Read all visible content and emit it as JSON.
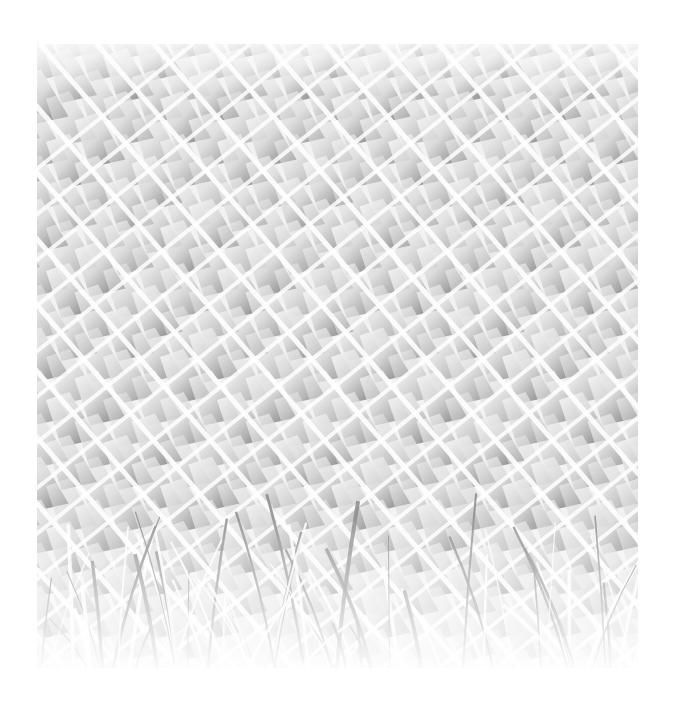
{
  "image": {
    "description": "High-key grayscale photograph of a diagonal chain-link / lattice fence with grass blades in the foreground",
    "alt": "Chain-link fence with grass",
    "palette": {
      "background": "#ffffff",
      "light": "#f4f4f4",
      "mid": "#b8b8b8",
      "dark": "#3a3a3a"
    },
    "frame": {
      "x": 37,
      "y": 44,
      "width": 601,
      "height": 624
    },
    "grid": {
      "cell_dx": 57,
      "cell_dy": 43
    }
  }
}
